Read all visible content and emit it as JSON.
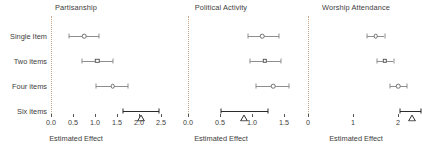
{
  "figure": {
    "width": 422,
    "height": 158,
    "background": "#ffffff",
    "marker_color": "#6f6f6f",
    "highlight_color": "#2b2b2b",
    "zeroline_color": "#c9a88a"
  },
  "chart_data": {
    "type": "scatter",
    "title": "",
    "xlabel": "Estimated Effect",
    "ylabel": "",
    "grid": false,
    "legend": null,
    "orientation": "horizontal",
    "categories": [
      "Single Item",
      "Two items",
      "Four items",
      "Six items"
    ],
    "panels": [
      {
        "title": "Partisanship",
        "xlabel": "Estimated Effect",
        "xlim": [
          0.0,
          2.5
        ],
        "xticks": [
          0.0,
          0.5,
          1.0,
          1.5,
          2.0,
          2.5
        ],
        "xticklabels": [
          "0.0",
          "0.5",
          "1.0",
          "1.5",
          "2.0",
          "2.5"
        ],
        "reference_line": 0.0,
        "points": [
          {
            "label": "Single Item",
            "estimate": 0.75,
            "low": 0.41,
            "high": 1.09,
            "marker": "circle",
            "highlight": false
          },
          {
            "label": "Two items",
            "estimate": 1.05,
            "low": 0.7,
            "high": 1.4,
            "marker": "square",
            "highlight": false
          },
          {
            "label": "Four items",
            "estimate": 1.4,
            "low": 1.03,
            "high": 1.76,
            "marker": "circle",
            "highlight": false
          },
          {
            "label": "Six items",
            "estimate": 2.04,
            "low": 1.63,
            "high": 2.45,
            "marker": "triangle",
            "highlight": true
          }
        ]
      },
      {
        "title": "Political Activity",
        "xlabel": "Estimated Effect",
        "xlim": [
          0.0,
          1.6
        ],
        "xticks": [
          0.0,
          0.5,
          1.0,
          1.5
        ],
        "xticklabels": [
          "0.0",
          "0.5",
          "1.0",
          "1.5"
        ],
        "reference_line": 0.0,
        "points": [
          {
            "label": "Single Item",
            "estimate": 1.16,
            "low": 0.93,
            "high": 1.42,
            "marker": "circle",
            "highlight": false
          },
          {
            "label": "Two items",
            "estimate": 1.2,
            "low": 0.97,
            "high": 1.45,
            "marker": "square",
            "highlight": false
          },
          {
            "label": "Four items",
            "estimate": 1.33,
            "low": 1.06,
            "high": 1.58,
            "marker": "circle",
            "highlight": false
          },
          {
            "label": "Six items",
            "estimate": 0.88,
            "low": 0.52,
            "high": 1.25,
            "marker": "triangle",
            "highlight": true
          }
        ]
      },
      {
        "title": "Worship Attendance",
        "xlabel": "Estimated Effect",
        "xlim": [
          0.0,
          2.6
        ],
        "xticks": [
          0,
          1,
          2
        ],
        "xticklabels": [
          "0",
          "1",
          "2"
        ],
        "reference_line": 0.0,
        "points": [
          {
            "label": "Single Item",
            "estimate": 1.5,
            "low": 1.32,
            "high": 1.7,
            "marker": "circle",
            "highlight": false
          },
          {
            "label": "Two items",
            "estimate": 1.7,
            "low": 1.53,
            "high": 1.9,
            "marker": "square",
            "highlight": false
          },
          {
            "label": "Four items",
            "estimate": 2.0,
            "low": 1.83,
            "high": 2.2,
            "marker": "circle",
            "highlight": false
          },
          {
            "label": "Six items",
            "estimate": 2.3,
            "low": 2.05,
            "high": 2.5,
            "marker": "triangle",
            "highlight": true
          }
        ]
      }
    ]
  }
}
